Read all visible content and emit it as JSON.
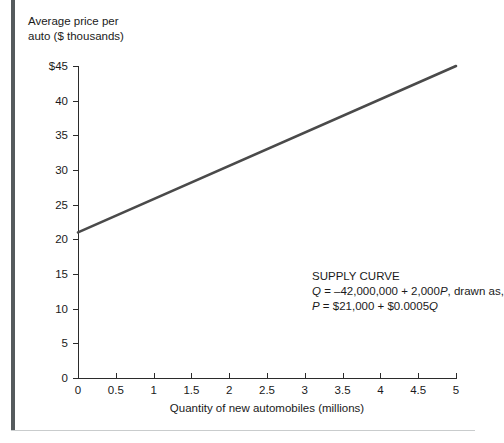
{
  "figure": {
    "y_axis_title": "Average price per\nauto ($ thousands)",
    "x_axis_title": "Quantity of new automobiles (millions)"
  },
  "annotation": {
    "heading": "SUPPLY CURVE",
    "line2_prefix": "Q",
    "line2_body": " = –42,000,000 + 2,000",
    "line2_var": "P",
    "line2_suffix": ", drawn as,",
    "line3_prefix": "P",
    "line3_body": " = $21,000 + $0.0005",
    "line3_var": "Q"
  },
  "chart_data": {
    "type": "line",
    "title": "",
    "xlabel": "Quantity of new automobiles (millions)",
    "ylabel": "Average price per auto ($ thousands)",
    "xlim": [
      0,
      5
    ],
    "ylim": [
      0,
      45
    ],
    "grid": false,
    "legend": null,
    "xticks": [
      0,
      0.5,
      1,
      1.5,
      2,
      2.5,
      3,
      3.5,
      4,
      4.5,
      5
    ],
    "xticklabels": [
      "0",
      "0.5",
      "1",
      "1.5",
      "2",
      "2.5",
      "3",
      "3.5",
      "4",
      "4.5",
      "5"
    ],
    "yticks": [
      0,
      5,
      10,
      15,
      20,
      25,
      30,
      35,
      40,
      45
    ],
    "yticklabels": [
      "0",
      "5",
      "10",
      "15",
      "20",
      "25",
      "30",
      "35",
      "40",
      "$45"
    ],
    "series": [
      {
        "name": "Supply curve",
        "color": "#4a4a4a",
        "linewidth": 2.6,
        "x": [
          0,
          5
        ],
        "y": [
          21,
          45
        ],
        "equation_quantity": "Q = -42,000,000 + 2,000P",
        "equation_price": "P = $21,000 + $0.0005Q"
      }
    ],
    "annotations": [
      {
        "text": "SUPPLY CURVE\nQ = –42,000,000 + 2,000P, drawn as,\nP = $21,000 + $0.0005Q",
        "x": 2.05,
        "y": 25.5
      }
    ]
  },
  "colors": {
    "line": "#4a4a4a",
    "axis": "#2b2b2b",
    "frame_bar": "#555b5d",
    "frame_rule": "#c9cccd",
    "text": "#1a1a1a",
    "background": "#ffffff"
  }
}
